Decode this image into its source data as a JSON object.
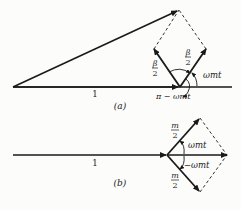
{
  "diagram": {
    "type": "phasor-diagram",
    "panels": [
      {
        "id": "a",
        "caption": "(a)",
        "carrier_label": "1",
        "sideband_label_left": {
          "num": "β",
          "den": "2"
        },
        "sideband_label_right": {
          "num": "β",
          "den": "2"
        },
        "angle_label_right": "ωmt",
        "angle_label_bottom": "π − ωmt",
        "description": "Narrowband FM phasor: carrier of length 1 plus two sidebands of length β/2 whose resultant is perpendicular to the carrier"
      },
      {
        "id": "b",
        "caption": "(b)",
        "carrier_label": "1",
        "sideband_label_upper": {
          "num": "m",
          "den": "2"
        },
        "sideband_label_lower": {
          "num": "m",
          "den": "2"
        },
        "angle_label_upper": "ωmt",
        "angle_label_lower": "−ωmt",
        "description": "AM phasor: carrier of length 1 plus two sidebands of length m/2 whose resultant lies along the carrier"
      }
    ],
    "colors": {
      "ink": "#1a1a1a",
      "paper": "#fcfcfa"
    }
  }
}
